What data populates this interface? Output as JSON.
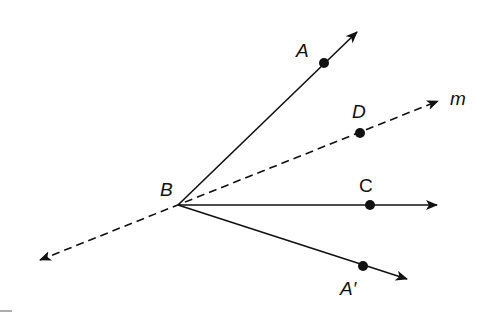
{
  "diagram": {
    "type": "geometry-reflection",
    "colors": {
      "stroke": "#111111",
      "background": "#ffffff"
    },
    "vertex": {
      "label": "B",
      "x": 178,
      "y": 205
    },
    "rays": [
      {
        "name": "ray-BA",
        "style": "solid",
        "to": [
          357,
          32
        ]
      },
      {
        "name": "ray-BC",
        "style": "solid",
        "to": [
          437,
          205
        ]
      },
      {
        "name": "ray-BA-prime",
        "style": "solid",
        "to": [
          407,
          279
        ]
      }
    ],
    "line_m": {
      "label": "m",
      "style": "dashed",
      "from": [
        40,
        260
      ],
      "to": [
        438,
        101
      ]
    },
    "points": [
      {
        "label": "A",
        "x": 324,
        "y": 63
      },
      {
        "label": "D",
        "x": 360,
        "y": 133
      },
      {
        "label": "C",
        "x": 370,
        "y": 205
      },
      {
        "label": "A′",
        "x": 363,
        "y": 266
      }
    ],
    "labels": {
      "A": "A",
      "B": "B",
      "C": "C",
      "D": "D",
      "A_prime": "A′",
      "m": "m"
    }
  }
}
